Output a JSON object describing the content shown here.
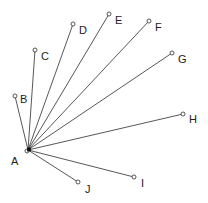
{
  "diagram": {
    "type": "star-graph",
    "hub": {
      "id": "A",
      "label": "A",
      "x": 28,
      "y": 150,
      "label_x": 11,
      "label_y": 165
    },
    "nodes": [
      {
        "id": "B",
        "label": "B",
        "x": 15,
        "y": 96,
        "label_x": 20,
        "label_y": 103
      },
      {
        "id": "C",
        "label": "C",
        "x": 35,
        "y": 50,
        "label_x": 41,
        "label_y": 60
      },
      {
        "id": "D",
        "label": "D",
        "x": 73,
        "y": 24,
        "label_x": 79,
        "label_y": 34
      },
      {
        "id": "E",
        "label": "E",
        "x": 109,
        "y": 14,
        "label_x": 115,
        "label_y": 24
      },
      {
        "id": "F",
        "label": "F",
        "x": 149,
        "y": 21,
        "label_x": 155,
        "label_y": 31
      },
      {
        "id": "G",
        "label": "G",
        "x": 172,
        "y": 53,
        "label_x": 178,
        "label_y": 63
      },
      {
        "id": "H",
        "label": "H",
        "x": 183,
        "y": 114,
        "label_x": 189,
        "label_y": 123
      },
      {
        "id": "I",
        "label": "I",
        "x": 134,
        "y": 177,
        "label_x": 141,
        "label_y": 187
      },
      {
        "id": "J",
        "label": "J",
        "x": 78,
        "y": 182,
        "label_x": 85,
        "label_y": 193
      }
    ],
    "colors": {
      "edge": "#444444",
      "hub": "#111111",
      "text": "#222222",
      "background": "#ffffff"
    }
  }
}
